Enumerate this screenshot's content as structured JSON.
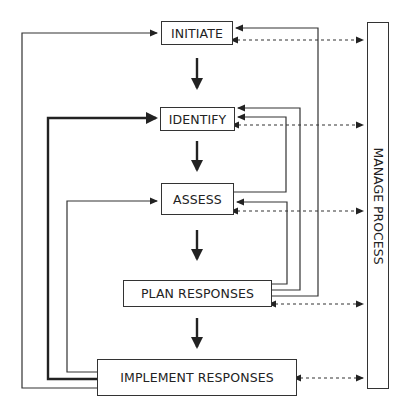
{
  "diagram": {
    "nodes": [
      {
        "id": "initiate",
        "label": "INITIATE"
      },
      {
        "id": "identify",
        "label": "IDENTIFY"
      },
      {
        "id": "assess",
        "label": "ASSESS"
      },
      {
        "id": "plan",
        "label": "PLAN RESPONSES"
      },
      {
        "id": "implement",
        "label": "IMPLEMENT RESPONSES"
      },
      {
        "id": "manage",
        "label": "MANAGE PROCESS"
      }
    ],
    "edges": [
      {
        "from": "initiate",
        "to": "identify",
        "style": "thick-solid"
      },
      {
        "from": "identify",
        "to": "assess",
        "style": "thick-solid"
      },
      {
        "from": "assess",
        "to": "plan",
        "style": "thick-solid"
      },
      {
        "from": "plan",
        "to": "implement",
        "style": "thick-solid"
      },
      {
        "from": "assess",
        "to": "identify",
        "style": "solid-feedback"
      },
      {
        "from": "plan",
        "to": "assess",
        "style": "solid-feedback"
      },
      {
        "from": "plan",
        "to": "identify",
        "style": "solid-feedback"
      },
      {
        "from": "plan",
        "to": "initiate",
        "style": "solid-feedback"
      },
      {
        "from": "implement",
        "to": "initiate",
        "style": "solid-feedback"
      },
      {
        "from": "implement",
        "to": "identify",
        "style": "thick-feedback"
      },
      {
        "from": "implement",
        "to": "assess",
        "style": "solid-feedback"
      },
      {
        "from": "manage",
        "to": "initiate",
        "style": "dashed-bidirectional"
      },
      {
        "from": "manage",
        "to": "identify",
        "style": "dashed-bidirectional"
      },
      {
        "from": "manage",
        "to": "assess",
        "style": "dashed-bidirectional"
      },
      {
        "from": "manage",
        "to": "plan",
        "style": "dashed-bidirectional"
      },
      {
        "from": "manage",
        "to": "implement",
        "style": "dashed-bidirectional"
      }
    ]
  }
}
